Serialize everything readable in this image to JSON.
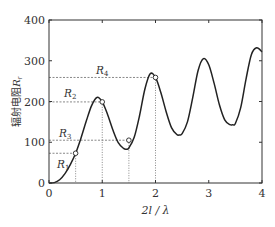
{
  "chart_data": {
    "type": "line",
    "title": "",
    "xlabel": "2l / λ",
    "ylabel": "辐射电阻R_r",
    "ylabel_text": "辐射电阻",
    "ylabel_symbol": "R",
    "ylabel_sub": "r",
    "xlim": [
      0,
      4
    ],
    "ylim": [
      0,
      400
    ],
    "xticks": [
      0,
      1,
      2,
      3,
      4
    ],
    "yticks": [
      0,
      100,
      200,
      300,
      400
    ],
    "xtick_labels": [
      "0",
      "1",
      "2",
      "3",
      "4"
    ],
    "ytick_labels": [
      "0",
      "100",
      "200",
      "300",
      "400"
    ],
    "grid": false,
    "legend": null,
    "series": [
      {
        "name": "R_r",
        "x": [
          0,
          0.1,
          0.2,
          0.3,
          0.4,
          0.5,
          0.6,
          0.7,
          0.8,
          0.9,
          1.0,
          1.1,
          1.2,
          1.3,
          1.4,
          1.45,
          1.5,
          1.6,
          1.7,
          1.8,
          1.9,
          2.0,
          2.1,
          2.2,
          2.3,
          2.4,
          2.45,
          2.5,
          2.6,
          2.7,
          2.8,
          2.9,
          3.0,
          3.1,
          3.2,
          3.3,
          3.4,
          3.45,
          3.5,
          3.6,
          3.7,
          3.8,
          3.9,
          4.0
        ],
        "y": [
          0,
          1,
          8,
          23,
          45,
          73,
          110,
          152,
          190,
          210,
          199,
          168,
          130,
          99,
          85,
          83,
          86,
          112,
          165,
          230,
          268,
          259,
          222,
          175,
          136,
          119,
          118,
          121,
          150,
          210,
          276,
          305,
          290,
          245,
          192,
          155,
          143,
          143,
          146,
          185,
          255,
          315,
          332,
          322
        ]
      }
    ],
    "markers": [
      {
        "label": "R",
        "sub": "1",
        "x": 0.5,
        "y": 73
      },
      {
        "label": "R",
        "sub": "2",
        "x": 1.0,
        "y": 199
      },
      {
        "label": "R",
        "sub": "3",
        "x": 1.5,
        "y": 105
      },
      {
        "label": "R",
        "sub": "4",
        "x": 2.0,
        "y": 259
      }
    ]
  }
}
